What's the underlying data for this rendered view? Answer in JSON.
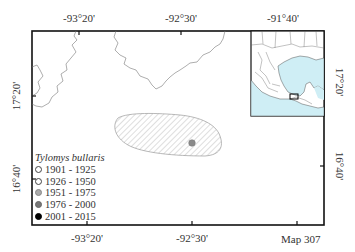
{
  "map": {
    "label": "Map 307",
    "top_axis": [
      {
        "label": "-93°20'",
        "x": 79
      },
      {
        "label": "-92°30'",
        "x": 181
      },
      {
        "label": "-91°40'",
        "x": 283
      }
    ],
    "bottom_axis": [
      {
        "label": "-93°20'",
        "x": 87
      },
      {
        "label": "-92°30'",
        "x": 192
      },
      {
        "label": "Map 307",
        "x": 297
      }
    ],
    "left_axis": [
      {
        "label": "17°20'",
        "y": 96
      },
      {
        "label": "16°40'",
        "y": 179
      }
    ],
    "right_axis": [
      {
        "label": "17°20'",
        "y": 82
      },
      {
        "label": "16°40'",
        "y": 166
      }
    ],
    "range_polygon": {
      "fill": "hatched",
      "stroke": "#999999"
    },
    "records": [
      {
        "x": 192,
        "y": 143,
        "period": "1976 - 2000",
        "color": "#888888"
      }
    ],
    "inset": {
      "water_color": "#cfeef5",
      "land_color": "#ffffff"
    }
  },
  "legend": {
    "title": "Tylomys bullaris",
    "items": [
      {
        "label": "1901 - 1925",
        "fill": "#ffffff"
      },
      {
        "label": "1926 - 1950",
        "fill": "#ffffff"
      },
      {
        "label": "1951 - 1975",
        "fill": "#aaaaaa"
      },
      {
        "label": "1976 - 2000",
        "fill": "#777777"
      },
      {
        "label": "2001 - 2015",
        "fill": "#000000"
      }
    ]
  }
}
